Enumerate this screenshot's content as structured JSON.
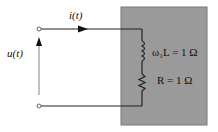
{
  "circuit": {
    "current_label": "i(t)",
    "voltage_label": "u(t)",
    "inductor_label": "ω₁L = 1 Ω",
    "resistor_label": "R = 1 Ω",
    "box_color": "#9a9a9a"
  }
}
